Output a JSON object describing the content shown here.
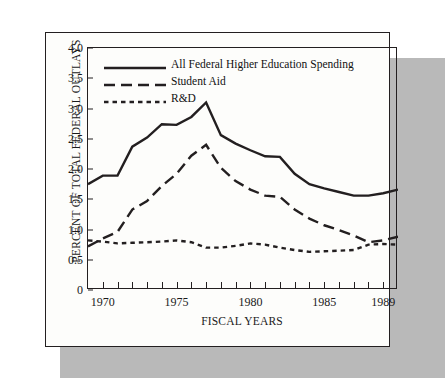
{
  "figure": {
    "ylabel": "PERCENT OF TOTAL FEDERAL OUTLAYS",
    "xlabel": "FISCAL YEARS"
  },
  "colors": {
    "ink": "#231f20",
    "paper": "#fdfdfb",
    "shadow": "#b9b9b9"
  },
  "legend": [
    {
      "label": "All Federal Higher Education Spending",
      "style": "solid"
    },
    {
      "label": "Student Aid",
      "style": "long-dash"
    },
    {
      "label": "R&D",
      "style": "short-dash"
    }
  ],
  "chart_data": {
    "type": "line",
    "title": "",
    "subtitle": "",
    "xlabel": "FISCAL YEARS",
    "ylabel": "PERCENT OF TOTAL FEDERAL OUTLAYS",
    "xlim": [
      1969,
      1990
    ],
    "ylim": [
      0,
      4.0
    ],
    "ytick_labels": [
      "0",
      "0.5",
      "1.0",
      "1.5",
      "2.0",
      "2.5",
      "3.0",
      "3.5",
      "4.0"
    ],
    "yticks": [
      0,
      0.5,
      1.0,
      1.5,
      2.0,
      2.5,
      3.0,
      3.5,
      4.0
    ],
    "xticks": [
      1969,
      1970,
      1971,
      1972,
      1973,
      1974,
      1975,
      1976,
      1977,
      1978,
      1979,
      1980,
      1981,
      1982,
      1983,
      1984,
      1985,
      1986,
      1987,
      1988,
      1989,
      1990
    ],
    "xtick_labels": [
      {
        "x": 1970,
        "label": "1970"
      },
      {
        "x": 1975,
        "label": "1975"
      },
      {
        "x": 1980,
        "label": "1980"
      },
      {
        "x": 1985,
        "label": "1985"
      },
      {
        "x": 1989,
        "label": "1989"
      }
    ],
    "grid": false,
    "legend_position": "upper-left-inside",
    "x": [
      1969,
      1970,
      1971,
      1972,
      1973,
      1974,
      1975,
      1976,
      1977,
      1978,
      1979,
      1980,
      1981,
      1982,
      1983,
      1984,
      1985,
      1986,
      1987,
      1988,
      1989,
      1990
    ],
    "series": [
      {
        "name": "All Federal Higher Education Spending",
        "style": "solid",
        "values": [
          1.75,
          1.89,
          1.89,
          2.37,
          2.52,
          2.74,
          2.73,
          2.86,
          3.1,
          2.56,
          2.42,
          2.31,
          2.21,
          2.2,
          1.92,
          1.75,
          1.68,
          1.62,
          1.56,
          1.56,
          1.6,
          1.66
        ]
      },
      {
        "name": "Student Aid",
        "style": "long-dash",
        "values": [
          0.72,
          0.85,
          0.96,
          1.33,
          1.47,
          1.72,
          1.92,
          2.22,
          2.4,
          2.02,
          1.8,
          1.66,
          1.56,
          1.54,
          1.33,
          1.18,
          1.07,
          0.99,
          0.9,
          0.79,
          0.82,
          0.88
        ]
      },
      {
        "name": "R&D",
        "style": "short-dash",
        "values": [
          0.82,
          0.8,
          0.77,
          0.78,
          0.79,
          0.8,
          0.82,
          0.79,
          0.7,
          0.7,
          0.73,
          0.77,
          0.75,
          0.7,
          0.66,
          0.63,
          0.64,
          0.65,
          0.66,
          0.75,
          0.76,
          0.75
        ]
      }
    ]
  }
}
